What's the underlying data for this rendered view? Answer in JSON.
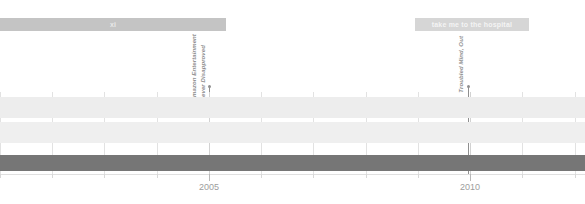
{
  "chart_data": {
    "type": "timeline",
    "title": "",
    "xlabel": "",
    "ylabel": "",
    "xlim": [
      2001.0,
      2012.2
    ],
    "grid": true,
    "legend_position": "none",
    "tick_labels": [
      "2005",
      "2010"
    ],
    "tick_values": [
      2005,
      2010
    ],
    "minor_tick_values": [
      2001,
      2002,
      2003,
      2004,
      2006,
      2007,
      2008,
      2009,
      2011,
      2012
    ],
    "banners": [
      {
        "name": "xi",
        "label": "xi",
        "start": 2001.0,
        "end": 2005.33,
        "color": "#c4c4c4",
        "text_color": "#e9e9e9"
      },
      {
        "name": "take me to the hospital",
        "label": "take me to the hospital",
        "start": 2008.95,
        "end": 2011.12,
        "color": "#d6d6d6",
        "text_color": "#f4f4f4"
      }
    ],
    "events": [
      {
        "label_lines": [
          "Amazon Entertainment",
          "Never Disapproved"
        ],
        "x": 2005.0,
        "color": "#8f8f8f"
      },
      {
        "label_lines": [
          "Troubled Mind, Out"
        ],
        "x": 2009.96,
        "color": "#8f8f8f"
      }
    ],
    "bands": [
      {
        "name": "band-row-0",
        "y_top": 5,
        "height": 21,
        "color": "#ededed",
        "start": 2001.0,
        "end": 2012.2
      },
      {
        "name": "band-row-1",
        "y_top": 30,
        "height": 21,
        "color": "#efefef",
        "start": 2001.0,
        "end": 2012.2
      },
      {
        "name": "band-row-2",
        "y_top": 63,
        "height": 16,
        "color": "#767676",
        "start": 2001.0,
        "end": 2012.2
      }
    ],
    "colors": {
      "background": "#ffffff",
      "gridline": "#e2e2e2",
      "gridline_major": "#d2d2d2",
      "axis_line": "#e0e0e0",
      "tick_label": "#9d9d9d",
      "marker": "#9a9a9a",
      "dark_band": "#767676"
    }
  }
}
